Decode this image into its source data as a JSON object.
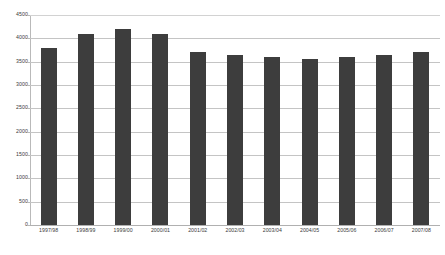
{
  "chart_data": {
    "type": "bar",
    "title": "",
    "subtitle": "",
    "xlabel": "",
    "ylabel": "",
    "categories": [
      "1997/98",
      "1998/99",
      "1999/00",
      "2000/01",
      "2001/02",
      "2002/03",
      "2003/04",
      "2004/05",
      "2005/06",
      "2006/07",
      "2007/08"
    ],
    "values": [
      3800,
      4100,
      4200,
      4100,
      3700,
      3650,
      3600,
      3550,
      3600,
      3650,
      3700
    ],
    "ylim": [
      0,
      4500
    ],
    "yticks": [
      0,
      500,
      1000,
      1500,
      2000,
      2500,
      3000,
      3500,
      4000,
      4500
    ],
    "ytick_labels": [
      "0",
      "500",
      "1000",
      "1500",
      "2000",
      "2500",
      "3000",
      "3500",
      "4000",
      "4500"
    ],
    "grid": true,
    "legend": null,
    "legend_position": "none",
    "series": [
      {
        "name": "",
        "color": "#3d3d3d",
        "values": [
          3800,
          4100,
          4200,
          4100,
          3700,
          3650,
          3600,
          3550,
          3600,
          3650,
          3700
        ]
      }
    ],
    "colors": {
      "bar": "#3d3d3d",
      "gridline": "#c4c4c4",
      "axis": "#b9b9b9",
      "text": "#3a3a3a",
      "background": "#ffffff"
    }
  }
}
